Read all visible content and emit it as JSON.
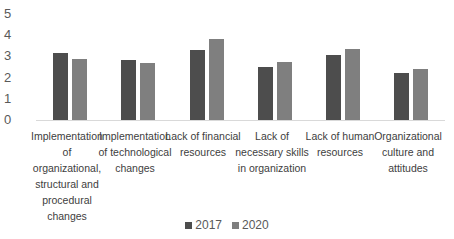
{
  "chart_data": {
    "type": "bar",
    "title": "",
    "xlabel": "",
    "ylabel": "",
    "ylim": [
      0,
      5
    ],
    "yticks": [
      0,
      1,
      2,
      3,
      4,
      5
    ],
    "grid": false,
    "legend_position": "bottom",
    "categories": [
      "Implementation of organizational, structural and procedural changes",
      "Implementation of technological changes",
      "Lack of financial resources",
      "Lack of necessary skills in organization",
      "Lack of human resources",
      "Organizational culture and attitudes"
    ],
    "series": [
      {
        "name": "2017",
        "color": "#4d4d4d",
        "values": [
          3.15,
          2.83,
          3.3,
          2.52,
          3.05,
          2.2
        ]
      },
      {
        "name": "2020",
        "color": "#7f7f7f",
        "values": [
          2.9,
          2.7,
          3.82,
          2.75,
          3.35,
          2.4
        ]
      }
    ]
  },
  "axis": {
    "ticks": [
      "5",
      "4",
      "3",
      "2",
      "1",
      "0"
    ]
  },
  "labels": [
    [
      "Implementation",
      "of",
      "organizational,",
      "structural and",
      "procedural",
      "changes"
    ],
    [
      "Implementation",
      "of technological",
      "changes"
    ],
    [
      "Lack of financial",
      "resources"
    ],
    [
      "Lack of",
      "necessary skills",
      "in organization"
    ],
    [
      "Lack of human",
      "resources"
    ],
    [
      "Organizational",
      "culture and",
      "attitudes"
    ]
  ],
  "legend": {
    "items": [
      {
        "label": "2017",
        "color": "#4d4d4d"
      },
      {
        "label": "2020",
        "color": "#7f7f7f"
      }
    ]
  }
}
